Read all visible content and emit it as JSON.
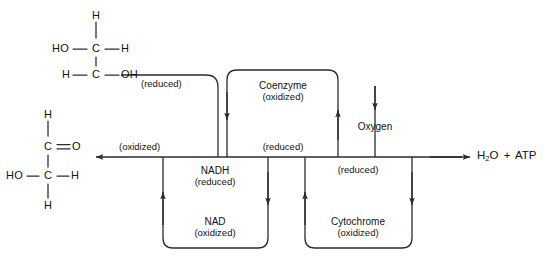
{
  "diagram": {
    "title_fragment": "",
    "colors": {
      "stroke": "#2b2b2b",
      "text": "#111111",
      "background": "#ffffff"
    },
    "molecules": {
      "substrate_reduced": {
        "name": "ethylene glycol / reduced substrate",
        "atoms": {
          "top_h": "H",
          "left_ho": "HO",
          "c1": "C",
          "right_h": "H",
          "bottom_left_h": "H",
          "c2": "C",
          "bottom_oh": "OH"
        }
      },
      "substrate_oxidized": {
        "name": "aldehyde / oxidized substrate",
        "atoms": {
          "top_h": "H",
          "c1": "C",
          "o": "O",
          "left_ho": "HO",
          "c2": "C",
          "right_h": "H",
          "bottom_h": "H"
        }
      }
    },
    "labels": {
      "substrate_reduced_state": "(reduced)",
      "substrate_oxidized_state": "(oxidized)",
      "coenzyme_oxidized_name": "Coenzyme",
      "coenzyme_oxidized_state": "(oxidized)",
      "coenzyme_reduced_state": "(reduced)",
      "nadh_name": "NADH",
      "nadh_state": "(reduced)",
      "nad_name": "NAD",
      "nad_state": "(oxidized)",
      "cytochrome_reduced_state": "(reduced)",
      "cytochrome_name": "Cytochrome",
      "cytochrome_state": "(oxidized)",
      "oxygen": "Oxygen",
      "products_water": "H",
      "products_water_sub": "2",
      "products_water_tail": "O",
      "products_plus": "+",
      "products_atp": "ATP"
    }
  }
}
